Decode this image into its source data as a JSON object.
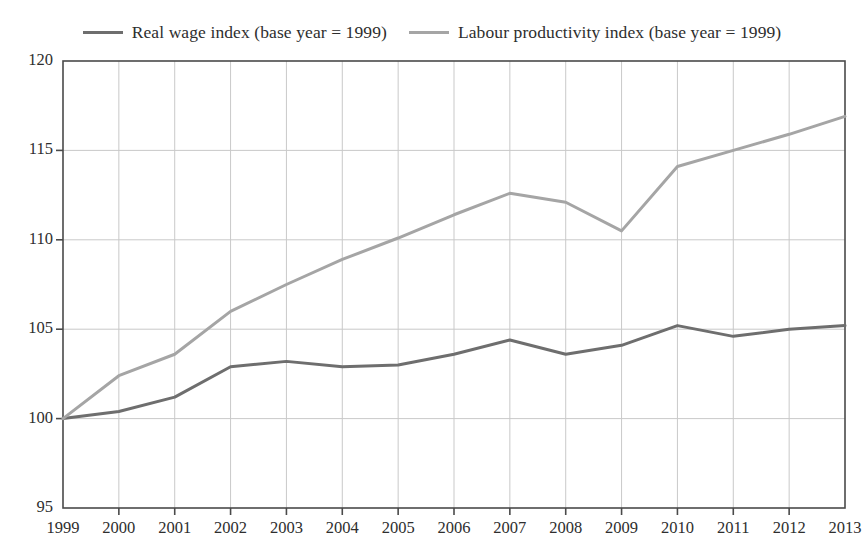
{
  "chart_data": {
    "type": "line",
    "title": "",
    "subtitle": "",
    "xlabel": "",
    "ylabel": "",
    "grid": true,
    "legend_position": "top-center",
    "categories": [
      "1999",
      "2000",
      "2001",
      "2002",
      "2003",
      "2004",
      "2005",
      "2006",
      "2007",
      "2008",
      "2009",
      "2010",
      "2011",
      "2012",
      "2013"
    ],
    "x": [
      1999,
      2000,
      2001,
      2002,
      2003,
      2004,
      2005,
      2006,
      2007,
      2008,
      2009,
      2010,
      2011,
      2012,
      2013
    ],
    "xlim": [
      1999,
      2013
    ],
    "ylim": [
      95,
      120
    ],
    "y_ticks": [
      95,
      100,
      105,
      110,
      115,
      120
    ],
    "y_tick_labels": [
      "95",
      "100",
      "105",
      "110",
      "115",
      "120"
    ],
    "x_tick_labels": [
      "1999",
      "2000",
      "2001",
      "2002",
      "2003",
      "2004",
      "2005",
      "2006",
      "2007",
      "2008",
      "2009",
      "2010",
      "2011",
      "2012",
      "2013"
    ],
    "series": [
      {
        "name": "Real wage index (base year = 1999)",
        "color": "#6e6e6e",
        "values": [
          100.0,
          100.4,
          101.2,
          102.9,
          103.2,
          102.9,
          103.0,
          103.6,
          104.4,
          103.6,
          104.1,
          105.2,
          104.6,
          105.0,
          105.2
        ]
      },
      {
        "name": "Labour productivity index (base year = 1999)",
        "color": "#a5a5a5",
        "values": [
          100.0,
          102.4,
          103.6,
          106.0,
          107.5,
          108.9,
          110.1,
          111.4,
          112.6,
          112.1,
          110.5,
          114.1,
          115.0,
          115.9,
          116.9
        ]
      }
    ]
  },
  "legend": {
    "entries": [
      {
        "label": "Real wage index (base year = 1999)",
        "color": "#6e6e6e"
      },
      {
        "label": "Labour productivity index (base year = 1999)",
        "color": "#a5a5a5"
      }
    ]
  },
  "style": {
    "axis_color": "#4a4a4a",
    "grid_color": "#c9c9c9",
    "background": "#ffffff",
    "text_color": "#2e2e2e"
  }
}
